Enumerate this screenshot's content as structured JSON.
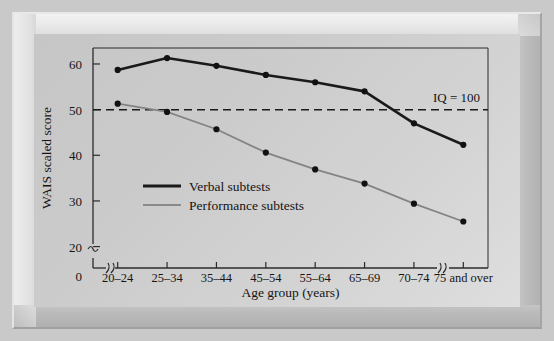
{
  "figure": {
    "background_color": "#c9c9c9",
    "panel_color": "#cccccc"
  },
  "chart_data": {
    "type": "line",
    "title": "",
    "xlabel": "Age group (years)",
    "ylabel": "WAIS scaled score",
    "categories": [
      "20–24",
      "25–34",
      "35–44",
      "45–54",
      "55–64",
      "65–69",
      "70–74",
      "75 and over"
    ],
    "series": [
      {
        "name": "Verbal subtests",
        "color": "#1a1a1a",
        "line_width": 2.6,
        "values": [
          58.7,
          61.3,
          59.6,
          57.6,
          56.0,
          54.0,
          47.0,
          42.3
        ]
      },
      {
        "name": "Performance subtests",
        "color": "#848484",
        "line_width": 1.8,
        "values": [
          51.3,
          49.5,
          45.7,
          40.6,
          36.9,
          33.8,
          29.4,
          25.5
        ]
      }
    ],
    "ylim": [
      17.5,
      63.5
    ],
    "y_ticks": [
      20,
      30,
      40,
      50,
      60
    ],
    "y_origin_label": "0",
    "y_axis_break": true,
    "x_axis_breaks": [
      "left",
      "right"
    ],
    "grid": false,
    "legend_position": "inside-lower-left",
    "reference_line": {
      "label": "IQ = 100",
      "value": 50,
      "style": "dashed",
      "color": "#1a1a1a"
    },
    "marker": {
      "shape": "circle",
      "color": "#111111",
      "radius": 3.1
    }
  },
  "axis": {
    "y_title": "WAIS scaled score",
    "x_title": "Age group (years)",
    "y_tick_labels": [
      "60",
      "50",
      "40",
      "30",
      "20"
    ],
    "y_zero_label": "0",
    "x_tick_labels": [
      "20–24",
      "25–34",
      "35–44",
      "45–54",
      "55–64",
      "65–69",
      "70–74",
      "75 and over"
    ]
  },
  "legend": {
    "items": [
      {
        "label": "Verbal subtests",
        "color": "#1a1a1a",
        "width": 3.0
      },
      {
        "label": "Performance subtests",
        "color": "#8a8a8a",
        "width": 2.0
      }
    ]
  },
  "annotation": {
    "iq_label": "IQ = 100"
  }
}
